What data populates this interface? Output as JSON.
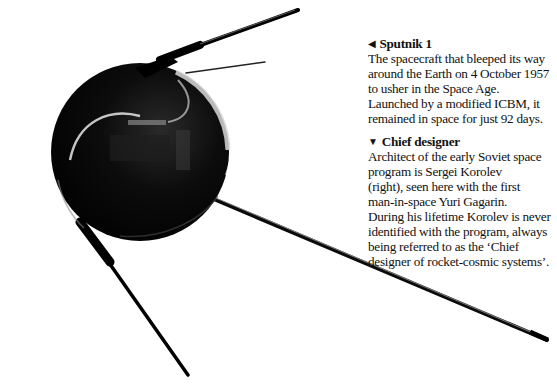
{
  "figure": {
    "icon": "sputnik-satellite-illustration"
  },
  "captions": [
    {
      "id": "sputnik",
      "arrow_icon": "left-triangle-icon",
      "arrow_glyph": "◀",
      "heading": "Sputnik 1",
      "lines": [
        "The spacecraft that bleeped its way",
        "around the Earth on 4 October 1957",
        "to usher in the Space Age.",
        "Launched by a modified ICBM, it",
        "remained in space for just 92 days."
      ]
    },
    {
      "id": "chief-designer",
      "arrow_icon": "down-triangle-icon",
      "arrow_glyph": "▼",
      "heading": "Chief designer",
      "lines": [
        "Architect of the early Soviet space",
        "program is Sergei Korolev",
        "(right), seen here with the first",
        "man-in-space Yuri Gagarin.",
        "During his lifetime Korolev is never",
        "identified with the program, always",
        "being referred to as the ‘Chief",
        "designer of rocket-cosmic systems’."
      ]
    }
  ],
  "colors": {
    "background": "#ffffff",
    "text": "#111111",
    "satellite": "#050505"
  }
}
